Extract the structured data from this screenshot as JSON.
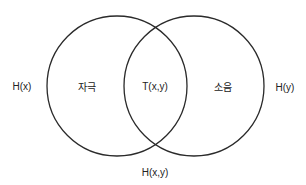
{
  "diagram": {
    "type": "venn",
    "stroke_color": "#2a2a2a",
    "circles": [
      {
        "id": "left",
        "cx": 117,
        "cy": 86,
        "r": 70
      },
      {
        "id": "right",
        "cx": 194,
        "cy": 86,
        "r": 70
      }
    ],
    "labels": {
      "hx": "H(x)",
      "stimulus": "자극",
      "txy": "T(x,y)",
      "noise": "소음",
      "hy": "H(y)",
      "hxy": "H(x,y)"
    }
  }
}
